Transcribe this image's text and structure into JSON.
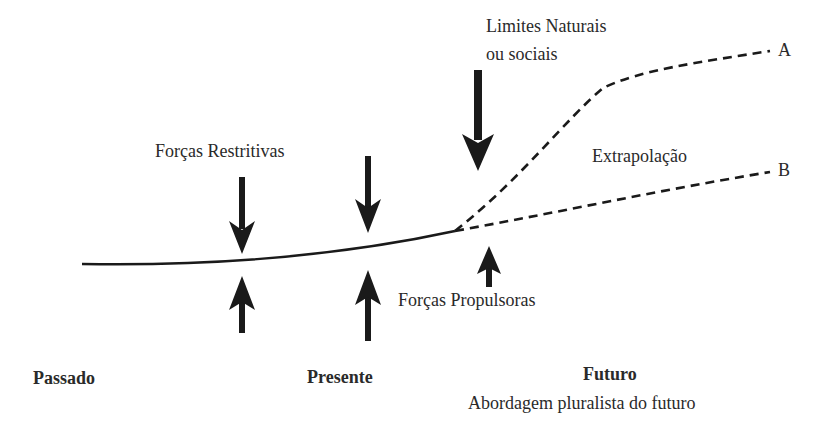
{
  "diagram": {
    "title": "",
    "colors": {
      "line": "#1a1a1a",
      "text": "#2a2a2a",
      "background": "#ffffff"
    },
    "labels": {
      "forcas_restritivas": "Forças Restritivas",
      "limites_line1": "Limites Naturais",
      "limites_line2": "ou sociais",
      "extrapolacao": "Extrapolação",
      "forcas_propulsoras": "Forças Propulsoras",
      "series_a": "A",
      "series_b": "B",
      "passado": "Passado",
      "presente": "Presente",
      "futuro": "Futuro",
      "futuro_subtitle": "Abordagem pluralista do futuro"
    },
    "nodes": [
      {
        "id": "past-trend",
        "type": "solid-curve",
        "label": ""
      },
      {
        "id": "scenario-a",
        "type": "dashed-line",
        "label": "A"
      },
      {
        "id": "scenario-b",
        "type": "dashed-line",
        "label": "B"
      },
      {
        "id": "restrictive-arrows",
        "type": "down-arrows",
        "count": 3,
        "label": "Forças Restritivas"
      },
      {
        "id": "propulsive-arrows",
        "type": "up-arrows",
        "count": 3,
        "label": "Forças Propulsoras"
      }
    ],
    "timeline": [
      "Passado",
      "Presente",
      "Futuro"
    ]
  }
}
